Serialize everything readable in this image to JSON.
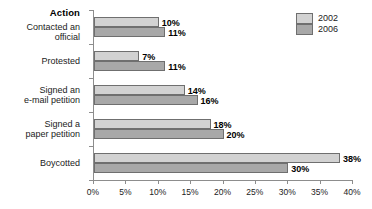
{
  "chart_data": {
    "type": "bar",
    "orientation": "horizontal",
    "title": "",
    "xlabel": "",
    "ylabel": "Action",
    "categories": [
      "Contacted an official",
      "Protested",
      "Signed an e-mail petition",
      "Signed a paper petition",
      "Boycotted"
    ],
    "category_label_lines": [
      [
        "Contacted an official"
      ],
      [
        "Protested"
      ],
      [
        "Signed an",
        "e-mail petition"
      ],
      [
        "Signed a",
        "paper petition"
      ],
      [
        "Boycotted"
      ]
    ],
    "series": [
      {
        "name": "2002",
        "color": "#d2d2d2",
        "values": [
          10,
          7,
          14,
          18,
          38
        ],
        "value_labels": [
          "10%",
          "7%",
          "14%",
          "18%",
          "38%"
        ]
      },
      {
        "name": "2006",
        "color": "#a8a8a8",
        "values": [
          11,
          11,
          16,
          20,
          30
        ],
        "value_labels": [
          "11%",
          "11%",
          "16%",
          "20%",
          "30%"
        ]
      }
    ],
    "xlim": [
      0,
      40
    ],
    "xticks": [
      0,
      5,
      10,
      15,
      20,
      25,
      30,
      35,
      40
    ],
    "xticklabels": [
      "0%",
      "5%",
      "10%",
      "15%",
      "20%",
      "25%",
      "30%",
      "35%",
      "40%"
    ],
    "grid": false,
    "legend_position": "top-right",
    "legend_entries": [
      "2002",
      "2006"
    ]
  },
  "axis_header": {
    "label": "Action"
  }
}
